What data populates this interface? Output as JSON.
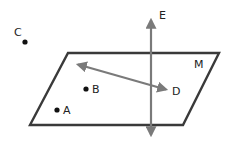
{
  "diagram": {
    "colors": {
      "plane_outline": "#3a3a3a",
      "line": "#7a7a7a",
      "point": "#111111",
      "label": "#222222"
    },
    "plane": {
      "label": "M",
      "corners": [
        [
          68,
          53
        ],
        [
          219,
          53
        ],
        [
          183,
          125
        ],
        [
          30,
          125
        ]
      ]
    },
    "vertical_line": {
      "label": "E",
      "from": [
        151,
        17
      ],
      "to": [
        151,
        138
      ]
    },
    "arrow_line": {
      "label": "D",
      "from": [
        76,
        64
      ],
      "to": [
        168,
        90
      ]
    },
    "points": [
      {
        "label": "C",
        "x": 25,
        "y": 42
      },
      {
        "label": "B",
        "x": 86,
        "y": 89
      },
      {
        "label": "A",
        "x": 57,
        "y": 110
      }
    ],
    "labels": {
      "A": "A",
      "B": "B",
      "C": "C",
      "D": "D",
      "E": "E",
      "M": "M"
    }
  }
}
